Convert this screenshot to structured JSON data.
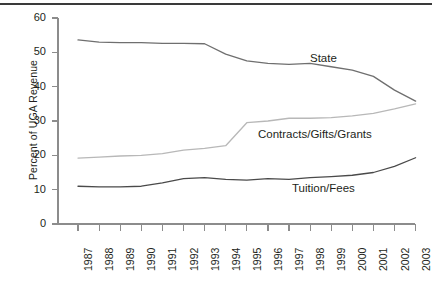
{
  "chart_data": {
    "type": "line",
    "title": "",
    "xlabel": "",
    "ylabel": "Percent of UGA Revenue",
    "ylim": [
      0,
      60
    ],
    "yticks": [
      0,
      10,
      20,
      30,
      40,
      50,
      60
    ],
    "grid": false,
    "legend_position": "inline-annotations",
    "categories": [
      "1987",
      "1988",
      "1989",
      "1990",
      "1991",
      "1992",
      "1993",
      "1994",
      "1995",
      "1996",
      "1997",
      "1998",
      "1999",
      "2000",
      "2001",
      "2002",
      "2003"
    ],
    "series": [
      {
        "name": "State",
        "color": "#6f6f6f",
        "label_x": 310,
        "label_y": 52,
        "values": [
          53.6,
          53.0,
          52.8,
          52.8,
          52.6,
          52.6,
          52.5,
          49.5,
          47.5,
          46.8,
          46.5,
          46.8,
          45.8,
          44.8,
          43.0,
          39.0,
          35.8
        ]
      },
      {
        "name": "Contracts/Gifts/Grants",
        "color": "#b8b8b8",
        "label_x": 258,
        "label_y": 128,
        "values": [
          19.2,
          19.5,
          19.8,
          20.0,
          20.5,
          21.5,
          22.0,
          22.8,
          29.5,
          30.0,
          30.8,
          30.8,
          31.0,
          31.5,
          32.2,
          33.5,
          35.0
        ]
      },
      {
        "name": "Tuition/Fees",
        "color": "#4a4a4a",
        "label_x": 292,
        "label_y": 182,
        "values": [
          11.0,
          10.8,
          10.8,
          11.0,
          12.0,
          13.2,
          13.5,
          13.0,
          12.8,
          13.2,
          13.0,
          13.5,
          13.8,
          14.2,
          15.0,
          16.8,
          19.3
        ]
      }
    ]
  },
  "axes": {
    "ytick_labels": [
      "60",
      "50",
      "40",
      "30",
      "20",
      "10",
      "0"
    ],
    "xtick_labels": [
      "1987",
      "1988",
      "1989",
      "1990",
      "1991",
      "1992",
      "1993",
      "1994",
      "1995",
      "1996",
      "1997",
      "1998",
      "1999",
      "2000",
      "2001",
      "2002",
      "2003"
    ],
    "axis_color": "#8c8c8c"
  }
}
